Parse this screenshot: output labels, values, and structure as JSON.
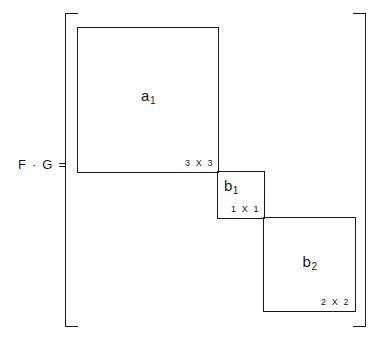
{
  "figure": {
    "equation_label": "F · G =",
    "blocks": [
      {
        "name_base": "a",
        "name_sub": "1",
        "dimension": "3 X 3"
      },
      {
        "name_base": "b",
        "name_sub": "1",
        "dimension": "1 X 1"
      },
      {
        "name_base": "b",
        "name_sub": "2",
        "dimension": "2 X 2"
      }
    ],
    "colors": {
      "line": "#1a1a1a",
      "background": "#ffffff"
    }
  }
}
